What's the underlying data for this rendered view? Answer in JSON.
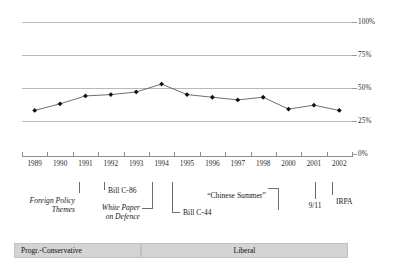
{
  "chart_data": {
    "type": "line",
    "title": "",
    "subtitle": "",
    "xlabel": "",
    "ylabel": "",
    "ylim": [
      0,
      100
    ],
    "ytick_labels": [
      "100%",
      "75%",
      "50%",
      "25%",
      "0%"
    ],
    "ytick_values": [
      100,
      75,
      50,
      25,
      0
    ],
    "grid": true,
    "legend_position": "none",
    "categories": [
      "1989",
      "1990",
      "1991",
      "1992",
      "1993",
      "1994",
      "1995",
      "1996",
      "1997",
      "1998",
      "2000",
      "2001",
      "2002"
    ],
    "series": [
      {
        "name": "",
        "marker": "filled-diamond",
        "values": [
          33,
          38,
          44,
          45,
          47,
          53,
          45,
          43,
          41,
          43,
          34,
          37,
          33
        ]
      }
    ],
    "annotations": [
      {
        "label": "Foreign Policy Themes",
        "style": "italic",
        "year": "1991"
      },
      {
        "label": "Bill C-86",
        "style": "regular",
        "year": "1992"
      },
      {
        "label": "White Paper on Defence",
        "style": "italic",
        "year": "1994"
      },
      {
        "label": "“Chinese Summer”",
        "style": "regular",
        "year": "1995"
      },
      {
        "label": "Bill C-44",
        "style": "regular",
        "year": "1995"
      },
      {
        "label": "9/11",
        "style": "regular",
        "year": "2001"
      },
      {
        "label": "IRPA",
        "style": "regular",
        "year": "2002"
      }
    ],
    "governing_party_bands": [
      {
        "label": "Progr.-Conservative",
        "start": "1989",
        "end": "1993"
      },
      {
        "label": "Liberal",
        "start": "1994",
        "end": "2002"
      }
    ]
  },
  "axes": {
    "y": {
      "ticks": [
        {
          "label": "100%"
        },
        {
          "label": "75%"
        },
        {
          "label": "50%"
        },
        {
          "label": "25%"
        },
        {
          "label": "0%"
        }
      ]
    },
    "x": {
      "ticks": [
        {
          "label": "1989"
        },
        {
          "label": "1990"
        },
        {
          "label": "1991"
        },
        {
          "label": "1992"
        },
        {
          "label": "1993"
        },
        {
          "label": "1994"
        },
        {
          "label": "1995"
        },
        {
          "label": "1996"
        },
        {
          "label": "1997"
        },
        {
          "label": "1998"
        },
        {
          "label": "2000"
        },
        {
          "label": "2001"
        },
        {
          "label": "2002"
        }
      ]
    }
  },
  "annotations": {
    "foreign_policy_themes": "Foreign Policy",
    "foreign_policy_themes_line2": "Themes",
    "bill_c86": "Bill C-86",
    "white_paper": "White Paper",
    "white_paper_line2": "on Defence",
    "chinese_summer": "“Chinese Summer”",
    "bill_c44": "Bill C-44",
    "nine_eleven": "9/11",
    "irpa": "IRPA"
  },
  "legend": {
    "progressive_conservative": "Progr.-Conservative",
    "liberal": "Liberal"
  },
  "colors": {
    "gridline": "#b9b9b9",
    "series_line": "#4a4a4a",
    "marker": "#111111",
    "axis": "#8d8d8d",
    "band_fill": "#d4d4d4",
    "text": "#1a1a1a"
  }
}
